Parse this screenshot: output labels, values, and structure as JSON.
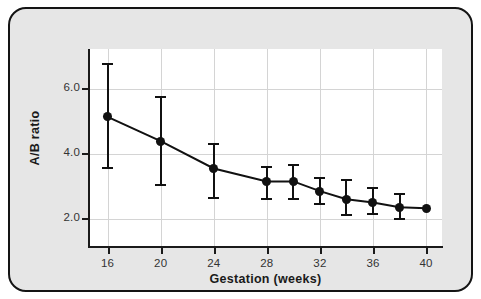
{
  "figure": {
    "background_color": "#e6e6e6",
    "border_color": "#141414",
    "plot_background_color": "#ffffff",
    "data_color": "#111111",
    "grid_color": "#d4d4d4"
  },
  "chart_data": {
    "type": "line",
    "title": "",
    "xlabel": "Gestation (weeks)",
    "ylabel": "A/B ratio",
    "xlim": [
      14.6,
      41.2
    ],
    "ylim": [
      1.15,
      7.25
    ],
    "grid": true,
    "legend": null,
    "xticks": [
      16,
      20,
      24,
      28,
      32,
      36,
      40
    ],
    "xticklabels": [
      "16",
      "20",
      "24",
      "28",
      "32",
      "36",
      "40"
    ],
    "yticks": [
      2.0,
      4.0,
      6.0
    ],
    "yticklabels": [
      "2.0",
      "4.0",
      "6.0"
    ],
    "series": [
      {
        "name": "A/B ratio",
        "marker": "filled-circle",
        "error_bars": "vertical",
        "x": [
          16,
          20,
          24,
          28,
          30,
          32,
          34,
          36,
          38,
          40
        ],
        "values": [
          5.15,
          4.4,
          3.55,
          3.15,
          3.15,
          2.85,
          2.6,
          2.5,
          2.35,
          2.32
        ],
        "err_low": [
          3.55,
          3.05,
          2.65,
          2.6,
          2.6,
          2.45,
          2.1,
          2.15,
          2.0,
          null
        ],
        "err_high": [
          6.8,
          5.75,
          4.3,
          3.6,
          3.65,
          3.25,
          3.2,
          2.95,
          2.75,
          null
        ]
      }
    ]
  }
}
